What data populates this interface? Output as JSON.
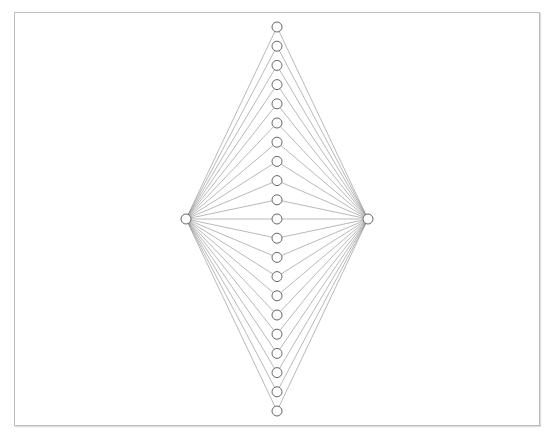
{
  "diagram": {
    "type": "bipartite-fan",
    "source_node": {
      "id": "left",
      "x": 186,
      "y": 219
    },
    "target_node": {
      "id": "right",
      "x": 368,
      "y": 219
    },
    "middle_column": {
      "x": 277,
      "y_start": 27,
      "y_end": 411,
      "count": 21
    },
    "node_radius": 5,
    "colors": {
      "edge": "#8a8a8a",
      "node_stroke": "#666666",
      "node_fill": "#ffffff",
      "frame": "#bdbdbd"
    }
  }
}
